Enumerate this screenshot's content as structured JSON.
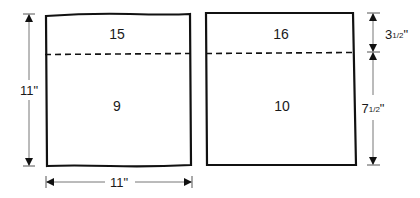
{
  "diagram": {
    "panels": [
      {
        "name": "left-panel",
        "top_section": "15",
        "bottom_section": "9"
      },
      {
        "name": "right-panel",
        "top_section": "16",
        "bottom_section": "10"
      }
    ],
    "dimensions": {
      "height_left": "11\"",
      "width_bottom": "11\"",
      "top_section_height_whole": "3",
      "top_section_height_frac": "1/2",
      "top_section_height_unit": "\"",
      "bottom_section_height_whole": "7",
      "bottom_section_height_frac": "1/2",
      "bottom_section_height_unit": "\""
    }
  }
}
